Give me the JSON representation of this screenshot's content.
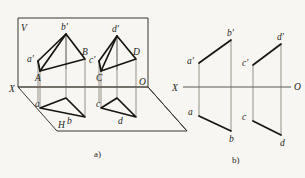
{
  "figure": {
    "title": "",
    "background_color": "#f7f6f2",
    "ink_color": "#17150f",
    "captions": {
      "part_a": "a)",
      "part_b": "b)"
    },
    "panel_a": {
      "name": "pictorial-projection-box",
      "plane_labels": {
        "vertical_plane": "V",
        "horizontal_plane": "H",
        "origin": "O",
        "x_axis": "X"
      },
      "front_quad_labels": {
        "a_front": "a'",
        "b_front": "b'",
        "a_space": "A",
        "b_space": "B",
        "a_top": "a",
        "b_top": "b"
      },
      "rear_quad_labels": {
        "c_front": "c'",
        "d_front": "d'",
        "c_space": "C",
        "d_space": "D",
        "c_top": "c",
        "d_top": "d"
      }
    },
    "panel_b": {
      "name": "orthographic-projection",
      "axis_labels": {
        "x_axis": "X",
        "origin": "O"
      },
      "left_figure_labels": {
        "a_front": "a'",
        "b_front": "b'",
        "a_top": "a",
        "b_top": "b"
      },
      "right_figure_labels": {
        "c_front": "c'",
        "d_front": "d'",
        "c_top": "c",
        "d_top": "d"
      }
    }
  }
}
